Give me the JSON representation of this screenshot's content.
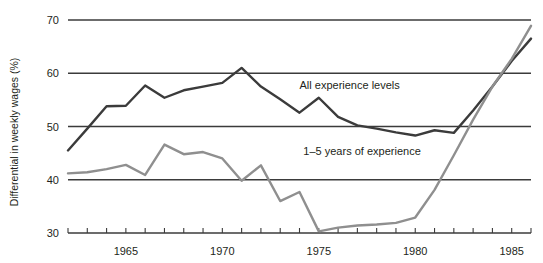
{
  "chart_data": {
    "type": "line",
    "title": "",
    "xlabel": "",
    "ylabel": "Differential in weekly wages (%)",
    "xlim": [
      1962,
      1986
    ],
    "ylim": [
      30,
      70
    ],
    "yticks": [
      30,
      40,
      50,
      60,
      70
    ],
    "ytick_labels": [
      "30",
      "40",
      "50",
      "60",
      "70"
    ],
    "xticks": [
      1962,
      1963,
      1964,
      1965,
      1966,
      1967,
      1968,
      1969,
      1970,
      1971,
      1972,
      1973,
      1974,
      1975,
      1976,
      1977,
      1978,
      1979,
      1980,
      1981,
      1982,
      1983,
      1984,
      1985,
      1986
    ],
    "xtick_labels_shown": [
      "1965",
      "1970",
      "1975",
      "1980",
      "1985"
    ],
    "xtick_labels_years": [
      1965,
      1970,
      1975,
      1980,
      1985
    ],
    "grid": "horizontal",
    "legend_position": "inline-annotation",
    "series": [
      {
        "name": "All experience levels",
        "color": "#3b3b3b",
        "label_x": 1974.0,
        "label_y": 57.0,
        "x": [
          1962,
          1963,
          1964,
          1965,
          1966,
          1967,
          1968,
          1969,
          1970,
          1971,
          1972,
          1973,
          1974,
          1975,
          1976,
          1977,
          1978,
          1979,
          1980,
          1981,
          1982,
          1983,
          1984,
          1985,
          1986
        ],
        "values": [
          45.5,
          49.6,
          53.8,
          53.9,
          57.7,
          55.4,
          56.8,
          57.5,
          58.2,
          61.0,
          57.5,
          55.1,
          52.6,
          55.4,
          51.8,
          50.2,
          49.6,
          48.9,
          48.3,
          49.3,
          48.8,
          53.0,
          57.5,
          62.3,
          66.5
        ]
      },
      {
        "name": "1–5 years of experience",
        "color": "#8f8f8f",
        "label_x": 1974.2,
        "label_y": 44.6,
        "x": [
          1962,
          1963,
          1964,
          1965,
          1966,
          1967,
          1968,
          1969,
          1970,
          1971,
          1972,
          1973,
          1974,
          1975,
          1976,
          1977,
          1978,
          1979,
          1980,
          1981,
          1982,
          1983,
          1984,
          1985,
          1986
        ],
        "values": [
          41.2,
          41.4,
          42.0,
          42.8,
          40.9,
          46.6,
          44.8,
          45.2,
          44.0,
          39.8,
          42.7,
          36.0,
          37.7,
          30.3,
          31.0,
          31.4,
          31.6,
          31.9,
          32.9,
          38.1,
          44.6,
          51.3,
          57.5,
          62.7,
          68.9
        ]
      }
    ]
  },
  "axis": {
    "y_title": "Differential in weekly wages (%)"
  }
}
